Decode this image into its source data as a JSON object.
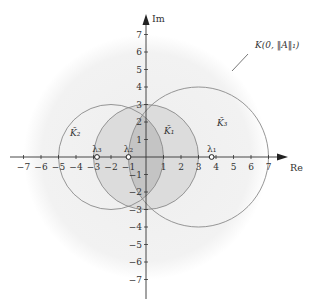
{
  "figure": {
    "axis_labels": {
      "x": "Re",
      "y": "Im"
    },
    "x_ticks": [
      "−7",
      "−6",
      "−5",
      "−4",
      "−3",
      "−2",
      "−1",
      "1",
      "2",
      "3",
      "4",
      "5",
      "6",
      "7"
    ],
    "x_tick_values": [
      -7,
      -6,
      -5,
      -4,
      -3,
      -2,
      -1,
      1,
      2,
      3,
      4,
      5,
      6,
      7
    ],
    "y_ticks": [
      "7",
      "6",
      "5",
      "4",
      "3",
      "2",
      "1",
      "−1",
      "−2",
      "−3",
      "−4",
      "−5",
      "−6",
      "−7"
    ],
    "y_tick_values": [
      7,
      6,
      5,
      4,
      3,
      2,
      1,
      -1,
      -2,
      -3,
      -4,
      -5,
      -6,
      -7
    ],
    "big_disc_label": "K(0, ‖A‖₁)",
    "circles": [
      {
        "name": "K̃1",
        "label": "K̃₁",
        "center": [
          0,
          0
        ],
        "radius": 3,
        "fill": "#dcdcdc"
      },
      {
        "name": "K̃2",
        "label": "K̃₂",
        "center": [
          -2,
          0
        ],
        "radius": 3,
        "fill": "none"
      },
      {
        "name": "K̃3",
        "label": "K̃₃",
        "center": [
          3,
          0
        ],
        "radius": 4,
        "fill": "none"
      }
    ],
    "big_disc": {
      "center": [
        0,
        0
      ],
      "radius": 7,
      "fill": "#f3f3f3"
    },
    "intersection_fill": "#c4c4c4",
    "eigenvalues": [
      {
        "label": "λ₁",
        "re": 3.75
      },
      {
        "label": "λ₂",
        "re": -1
      },
      {
        "label": "λ₃",
        "re": -2.8
      }
    ],
    "colors": {
      "circle_stroke": "#8a8a8a",
      "axis": "#333333"
    }
  }
}
